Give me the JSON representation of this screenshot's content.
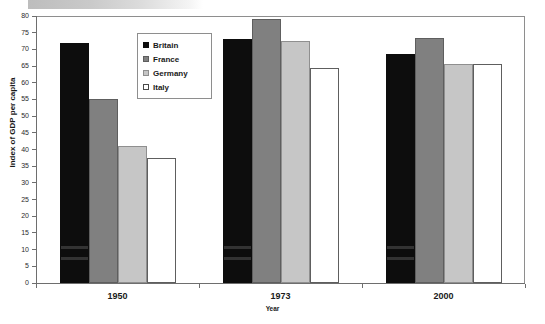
{
  "chart_data": {
    "type": "bar",
    "title": "",
    "xlabel": "Year",
    "ylabel": "Index of GDP per capita",
    "categories": [
      "1950",
      "1973",
      "2000"
    ],
    "series": [
      {
        "name": "Britain",
        "color": "#0d0d0d",
        "values": [
          72,
          73,
          68.5
        ]
      },
      {
        "name": "France",
        "color": "#808080",
        "values": [
          55,
          79,
          73.5
        ]
      },
      {
        "name": "Germany",
        "color": "#c6c6c6",
        "values": [
          41,
          72.5,
          65.5
        ]
      },
      {
        "name": "Italy",
        "color": "#ffffff",
        "values": [
          37.5,
          64.5,
          65.5
        ]
      }
    ],
    "ylim": [
      0,
      80
    ],
    "ytick_step": 5,
    "yticks": [
      "80",
      "75",
      "70",
      "65",
      "60",
      "55",
      "50",
      "45",
      "40",
      "35",
      "30",
      "25",
      "20",
      "15",
      "10",
      "5",
      "0"
    ],
    "grid": false,
    "legend_position": "upper-left-inside"
  },
  "legend": {
    "items": [
      {
        "label": "Britain"
      },
      {
        "label": "France"
      },
      {
        "label": "Germany"
      },
      {
        "label": "Italy"
      }
    ]
  }
}
